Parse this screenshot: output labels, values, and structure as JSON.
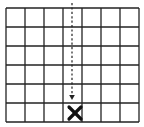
{
  "diagram": {
    "type": "grid-board",
    "columns": 7,
    "rows": 6,
    "grid": {
      "left": 6,
      "top": 8,
      "right": 139,
      "bottom": 122,
      "line_color": "#222222",
      "line_width": 1.3,
      "background": "#ffffff"
    },
    "drop_arrow": {
      "style": "dashed",
      "direction": "down",
      "column": 4,
      "x": 72,
      "y_start": 3,
      "y_end": 100,
      "color": "#222222"
    },
    "marker": {
      "symbol": "x-mark",
      "column": 4,
      "row": 6,
      "cx": 75,
      "cy": 113,
      "size": 14,
      "color": "#111111"
    }
  }
}
